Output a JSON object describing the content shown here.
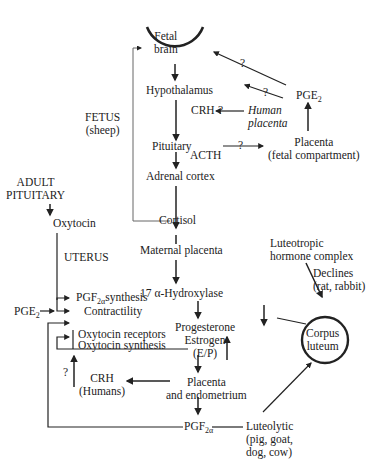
{
  "nodes": {
    "fetal_brain": [
      "Fetal",
      "brain"
    ],
    "hypothalamus": "Hypothalamus",
    "crh_fetal": "CRH",
    "human_placenta": [
      "Human",
      "placenta"
    ],
    "pge2_top": {
      "base": "PGE",
      "sub": "2"
    },
    "pituitary": "Pituitary",
    "acth": "ACTH",
    "placenta_fetal": [
      "Placenta",
      "(fetal compartment)"
    ],
    "fetus_label": [
      "FETUS",
      "(sheep)"
    ],
    "adrenal_cortex": "Adrenal cortex",
    "adult_pituitary": [
      "ADULT",
      "PITUITARY"
    ],
    "oxytocin": "Oxytocin",
    "cortisol": "Cortisol",
    "uterus_label": "UTERUS",
    "maternal_placenta": "Maternal placenta",
    "hydroxylase": "17 α-Hydroxylase",
    "luteotropic": [
      "Luteotropic",
      "hormone complex"
    ],
    "declines": [
      "Declines",
      "(rat, rabbit)"
    ],
    "pgf_synthesis": {
      "base": "PGF",
      "sub": "2α",
      "suffix": "synthesis"
    },
    "contractility": "Contractility",
    "pge2_left": {
      "base": "PGE",
      "sub": "2"
    },
    "progesterone": [
      "Progesterone",
      "Estrogen",
      "(E/P)"
    ],
    "corpus_luteum": [
      "Corpus",
      "luteum"
    ],
    "oxytocin_receptors": "Oxytocin receptors",
    "oxytocin_synthesis": "Oxytocin synthesis",
    "crh_humans": [
      "CRH",
      "(Humans)"
    ],
    "placenta_endometrium": [
      "Placenta",
      "and endometrium"
    ],
    "pgf_bottom": {
      "base": "PGF",
      "sub": "2α"
    },
    "luteolytic": [
      "Luteolytic",
      "(pig, goat,",
      "dog, cow)"
    ]
  },
  "question_marks": [
    "?",
    "?",
    "?",
    "?",
    "?"
  ],
  "colors": {
    "line": "#222222",
    "thin_line": "#555555",
    "text": "#222222"
  }
}
